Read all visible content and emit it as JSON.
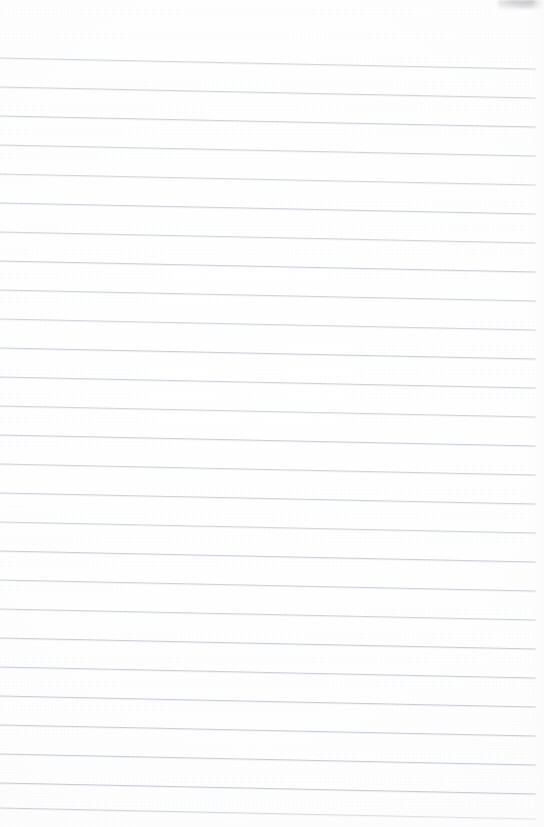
{
  "document": {
    "kind": "scanned-lined-notebook-page",
    "title": "Blank ruled notebook page",
    "page_width": 544,
    "page_height": 827,
    "background_color": "#fefefe",
    "paper_tone_color": "#fafafa",
    "has_written_content": false,
    "has_vertical_margin_rule": false,
    "text_content": ""
  },
  "ruling": {
    "line_color": "#b9bdc6",
    "line_color_light": "#d6d9df",
    "line_width_px": 1,
    "line_count": 26,
    "first_line_y_left": 58,
    "line_spacing_px": 29.0,
    "slope_drop_px": 11,
    "x_start": 0,
    "x_end": 536,
    "top_margin_px": 58,
    "bottom_margin_px": 19,
    "right_margin_px": 8,
    "lines": [
      {
        "index": 1,
        "y_left": 58.0,
        "y_right": 69.0,
        "opacity": 0.62
      },
      {
        "index": 2,
        "y_left": 87.0,
        "y_right": 98.0,
        "opacity": 0.66
      },
      {
        "index": 3,
        "y_left": 116.0,
        "y_right": 127.0,
        "opacity": 0.7
      },
      {
        "index": 4,
        "y_left": 145.0,
        "y_right": 156.0,
        "opacity": 0.66
      },
      {
        "index": 5,
        "y_left": 174.0,
        "y_right": 185.0,
        "opacity": 0.62
      },
      {
        "index": 6,
        "y_left": 203.0,
        "y_right": 214.0,
        "opacity": 0.7
      },
      {
        "index": 7,
        "y_left": 232.0,
        "y_right": 243.0,
        "opacity": 0.66
      },
      {
        "index": 8,
        "y_left": 261.0,
        "y_right": 272.0,
        "opacity": 0.72
      },
      {
        "index": 9,
        "y_left": 290.0,
        "y_right": 301.0,
        "opacity": 0.68
      },
      {
        "index": 10,
        "y_left": 319.0,
        "y_right": 330.0,
        "opacity": 0.64
      },
      {
        "index": 11,
        "y_left": 348.0,
        "y_right": 359.0,
        "opacity": 0.72
      },
      {
        "index": 12,
        "y_left": 377.0,
        "y_right": 388.0,
        "opacity": 0.7
      },
      {
        "index": 13,
        "y_left": 406.0,
        "y_right": 417.0,
        "opacity": 0.66
      },
      {
        "index": 14,
        "y_left": 435.0,
        "y_right": 446.0,
        "opacity": 0.72
      },
      {
        "index": 15,
        "y_left": 464.0,
        "y_right": 475.0,
        "opacity": 0.68
      },
      {
        "index": 16,
        "y_left": 493.0,
        "y_right": 504.0,
        "opacity": 0.7
      },
      {
        "index": 17,
        "y_left": 522.0,
        "y_right": 533.0,
        "opacity": 0.66
      },
      {
        "index": 18,
        "y_left": 551.0,
        "y_right": 562.0,
        "opacity": 0.72
      },
      {
        "index": 19,
        "y_left": 580.0,
        "y_right": 591.0,
        "opacity": 0.7
      },
      {
        "index": 20,
        "y_left": 609.0,
        "y_right": 620.0,
        "opacity": 0.68
      },
      {
        "index": 21,
        "y_left": 638.0,
        "y_right": 649.0,
        "opacity": 0.74
      },
      {
        "index": 22,
        "y_left": 667.0,
        "y_right": 678.0,
        "opacity": 0.72
      },
      {
        "index": 23,
        "y_left": 696.0,
        "y_right": 707.0,
        "opacity": 0.76
      },
      {
        "index": 24,
        "y_left": 725.0,
        "y_right": 736.0,
        "opacity": 0.74
      },
      {
        "index": 25,
        "y_left": 754.0,
        "y_right": 765.0,
        "opacity": 0.76
      },
      {
        "index": 26,
        "y_left": 783.0,
        "y_right": 794.0,
        "opacity": 0.78
      },
      {
        "index": 27,
        "y_left": 808.0,
        "y_right": 819.0,
        "opacity": 0.7
      }
    ]
  },
  "artifacts": {
    "corner_smudge": {
      "name": "top-right-scan-smudge",
      "color": "#6e7076",
      "x": 498,
      "y": 0,
      "width": 46,
      "height": 9
    }
  }
}
